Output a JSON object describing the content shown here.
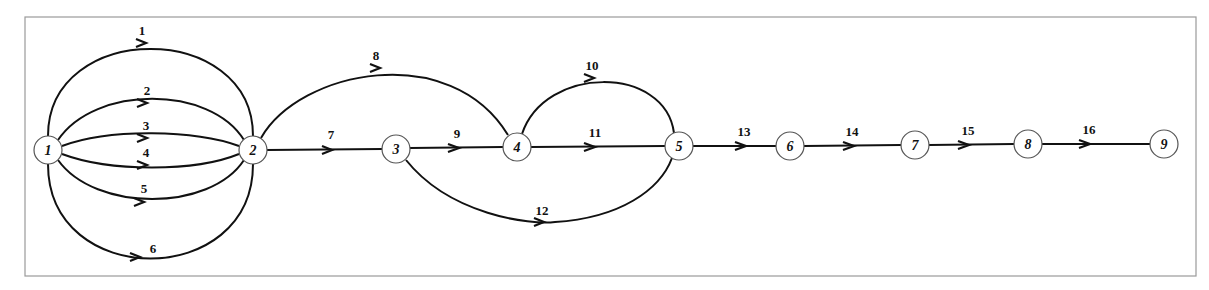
{
  "diagram": {
    "type": "directed-network-graph",
    "nodes": [
      {
        "id": "1",
        "label": "1",
        "x": 48,
        "y": 150
      },
      {
        "id": "2",
        "label": "2",
        "x": 253,
        "y": 150
      },
      {
        "id": "3",
        "label": "3",
        "x": 396,
        "y": 149
      },
      {
        "id": "4",
        "label": "4",
        "x": 517,
        "y": 147
      },
      {
        "id": "5",
        "label": "5",
        "x": 679,
        "y": 146
      },
      {
        "id": "6",
        "label": "6",
        "x": 790,
        "y": 146
      },
      {
        "id": "7",
        "label": "7",
        "x": 915,
        "y": 145
      },
      {
        "id": "8",
        "label": "8",
        "x": 1028,
        "y": 144
      },
      {
        "id": "9",
        "label": "9",
        "x": 1164,
        "y": 144
      }
    ],
    "edges": [
      {
        "id": "1",
        "label": "1",
        "from": "1",
        "to": "2"
      },
      {
        "id": "2",
        "label": "2",
        "from": "1",
        "to": "2"
      },
      {
        "id": "3",
        "label": "3",
        "from": "1",
        "to": "2"
      },
      {
        "id": "4",
        "label": "4",
        "from": "1",
        "to": "2"
      },
      {
        "id": "5",
        "label": "5",
        "from": "1",
        "to": "2"
      },
      {
        "id": "6",
        "label": "6",
        "from": "1",
        "to": "2"
      },
      {
        "id": "7",
        "label": "7",
        "from": "2",
        "to": "3"
      },
      {
        "id": "8",
        "label": "8",
        "from": "2",
        "to": "4"
      },
      {
        "id": "9",
        "label": "9",
        "from": "3",
        "to": "4"
      },
      {
        "id": "10",
        "label": "10",
        "from": "4",
        "to": "5"
      },
      {
        "id": "11",
        "label": "11",
        "from": "4",
        "to": "5"
      },
      {
        "id": "12",
        "label": "12",
        "from": "3",
        "to": "5"
      },
      {
        "id": "13",
        "label": "13",
        "from": "5",
        "to": "6"
      },
      {
        "id": "14",
        "label": "14",
        "from": "6",
        "to": "7"
      },
      {
        "id": "15",
        "label": "15",
        "from": "7",
        "to": "8"
      },
      {
        "id": "16",
        "label": "16",
        "from": "8",
        "to": "9"
      }
    ]
  }
}
